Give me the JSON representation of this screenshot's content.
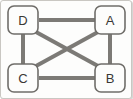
{
  "diagram": {
    "width": 132,
    "height": 99,
    "colors": {
      "background": "#fdfdfc",
      "border": "#c9c7c2",
      "edge": "#7c7a76",
      "node_fill": "#fdfdfc",
      "node_stroke": "#6f6d69",
      "label": "#3a3835"
    },
    "nodes": [
      {
        "id": "D",
        "label": "D",
        "x": 22,
        "y": 19,
        "w": 30,
        "h": 28
      },
      {
        "id": "A",
        "label": "A",
        "x": 109,
        "y": 19,
        "w": 30,
        "h": 28
      },
      {
        "id": "C",
        "label": "C",
        "x": 22,
        "y": 77,
        "w": 30,
        "h": 28
      },
      {
        "id": "B",
        "label": "B",
        "x": 109,
        "y": 77,
        "w": 30,
        "h": 28
      }
    ],
    "edges": [
      {
        "id": "edge-d-a",
        "from": "D",
        "to": "A",
        "x1": 38,
        "y1": 19,
        "x2": 94,
        "y2": 19
      },
      {
        "id": "edge-d-c",
        "from": "D",
        "to": "C",
        "x1": 22,
        "y1": 33,
        "x2": 22,
        "y2": 63
      },
      {
        "id": "edge-a-b",
        "from": "A",
        "to": "B",
        "x1": 109,
        "y1": 33,
        "x2": 109,
        "y2": 63
      },
      {
        "id": "edge-c-b",
        "from": "C",
        "to": "B",
        "x1": 38,
        "y1": 77,
        "x2": 94,
        "y2": 77
      },
      {
        "id": "edge-d-b",
        "from": "D",
        "to": "B",
        "x1": 35,
        "y1": 31,
        "x2": 97,
        "y2": 65
      },
      {
        "id": "edge-c-a",
        "from": "C",
        "to": "A",
        "x1": 35,
        "y1": 65,
        "x2": 97,
        "y2": 31
      }
    ]
  }
}
